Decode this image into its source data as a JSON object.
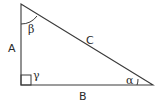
{
  "diagram": {
    "type": "right-triangle",
    "stroke_color": "#3a3a3a",
    "background": "#ffffff",
    "vertices": {
      "top": [
        21,
        4
      ],
      "right_angle": [
        21,
        85
      ],
      "bottom_right": [
        153,
        85
      ]
    },
    "sides": {
      "vertical": {
        "label": "A"
      },
      "horizontal": {
        "label": "B"
      },
      "hypotenuse": {
        "label": "C"
      }
    },
    "angles": {
      "top": {
        "label": "β"
      },
      "right_angle": {
        "label": "γ",
        "marker": "square"
      },
      "bottom_right": {
        "label": "α"
      }
    }
  }
}
